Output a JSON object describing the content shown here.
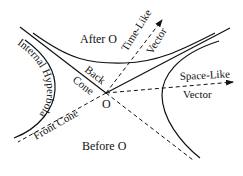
{
  "diagram": {
    "labels": {
      "after_o": "After O",
      "before_o": "Before O",
      "time_like": "Time-Like",
      "time_like_vector": "Vector",
      "space_like": "Space-Like",
      "space_like_vector": "Vector",
      "back": "Back",
      "cone": "Cone",
      "origin": "O",
      "front_cone": "Front Cone",
      "internal_hyperbola": "Internal Hyperbola"
    },
    "colors": {
      "ink": "#111111",
      "background": "#ffffff"
    }
  }
}
